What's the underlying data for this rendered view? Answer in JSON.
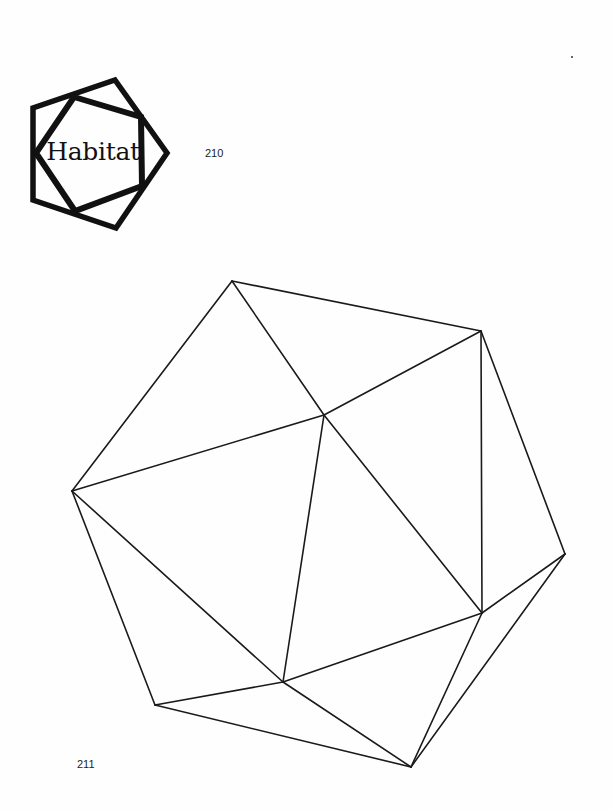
{
  "logo": {
    "text": "Habitat",
    "icon": "double-pentagon-icon",
    "color": "#111111"
  },
  "page_numbers": {
    "top": "210",
    "bottom": "211"
  },
  "figure": {
    "type": "icosahedron-line-drawing",
    "stroke_color": "#1a1a1a",
    "vertices": {
      "A": [
        232,
        281
      ],
      "B": [
        72,
        491
      ],
      "C": [
        324,
        415
      ],
      "D": [
        481,
        331
      ],
      "E": [
        565,
        554
      ],
      "F": [
        482,
        613
      ],
      "G": [
        411,
        767
      ],
      "H": [
        283,
        682
      ],
      "I": [
        155,
        705
      ]
    },
    "edges": [
      [
        "A",
        "B"
      ],
      [
        "A",
        "C"
      ],
      [
        "A",
        "D"
      ],
      [
        "B",
        "C"
      ],
      [
        "B",
        "H"
      ],
      [
        "B",
        "I"
      ],
      [
        "C",
        "D"
      ],
      [
        "C",
        "F"
      ],
      [
        "C",
        "H"
      ],
      [
        "D",
        "E"
      ],
      [
        "D",
        "F"
      ],
      [
        "E",
        "F"
      ],
      [
        "E",
        "G"
      ],
      [
        "F",
        "G"
      ],
      [
        "F",
        "H"
      ],
      [
        "H",
        "G"
      ],
      [
        "H",
        "I"
      ],
      [
        "I",
        "G"
      ]
    ]
  }
}
